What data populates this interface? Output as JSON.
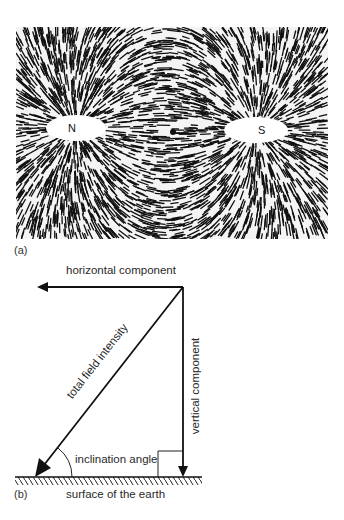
{
  "figure_a": {
    "panel_label": "(a)",
    "description": "iron filings around a bar magnet",
    "poles": {
      "north": "N",
      "south": "S"
    }
  },
  "figure_b": {
    "panel_label": "(b)",
    "labels": {
      "horizontal": "horizontal component",
      "vertical": "vertical component",
      "total": "total field intensity",
      "angle": "inclination angle",
      "ground": "surface of the earth"
    }
  },
  "colors": {
    "ink": "#111111",
    "paper": "#ffffff",
    "text": "#2a2a2a"
  }
}
